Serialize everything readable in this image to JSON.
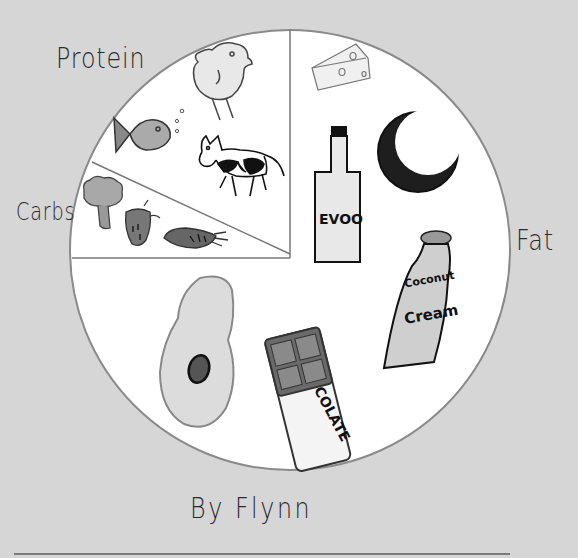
{
  "author": "By Flynn",
  "colors": {
    "background": "#d6d6d6",
    "plate": "#ffffff",
    "plate_outline": "#8a8a8a",
    "ink": "#222222"
  },
  "sections": [
    {
      "label": "Protein",
      "foods": [
        "chicken",
        "fish",
        "cow"
      ]
    },
    {
      "label": "Carbs",
      "foods": [
        "broccoli",
        "strawberry",
        "carrot"
      ]
    },
    {
      "label": "Fat",
      "foods": [
        "cheese",
        "EVOO",
        "coconut",
        "coconut cream",
        "avocado",
        "chocolate"
      ]
    }
  ],
  "food_text": {
    "evoo": "EVOO",
    "coconut_cream_line1": "Coconut",
    "coconut_cream_line2": "Cream",
    "chocolate": "COLATE"
  }
}
